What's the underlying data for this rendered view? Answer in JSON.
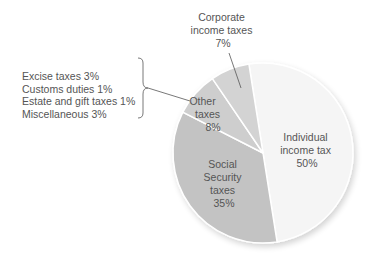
{
  "chart_data": {
    "type": "pie",
    "title": "",
    "slices": [
      {
        "label": "Individual income tax",
        "value": 50,
        "color": "#f5f5f5",
        "text_lines": [
          "Individual",
          "income tax",
          "50%"
        ]
      },
      {
        "label": "Social Security taxes",
        "value": 35,
        "color": "#c3c3c3",
        "text_lines": [
          "Social",
          "Security",
          "taxes",
          "35%"
        ]
      },
      {
        "label": "Other taxes",
        "value": 8,
        "color": "#cecece",
        "text_lines": [
          "Other",
          "taxes",
          "8%"
        ]
      },
      {
        "label": "Corporate income taxes",
        "value": 7,
        "color": "#d3d3d3",
        "text_lines": [
          "Corporate",
          "income taxes",
          "7%"
        ]
      }
    ],
    "other_breakdown": [
      {
        "label": "Excise taxes",
        "value": 3,
        "text": "Excise taxes 3%"
      },
      {
        "label": "Customs duties",
        "value": 1,
        "text": "Customs duties 1%"
      },
      {
        "label": "Estate and gift taxes",
        "value": 1,
        "text": "Estate and gift taxes 1%"
      },
      {
        "label": "Miscellaneous",
        "value": 3,
        "text": "Miscellaneous 3%"
      }
    ],
    "start_angle_deg": -9,
    "direction": "clockwise",
    "separator_color": "#ffffff",
    "text_color": "#555555"
  }
}
